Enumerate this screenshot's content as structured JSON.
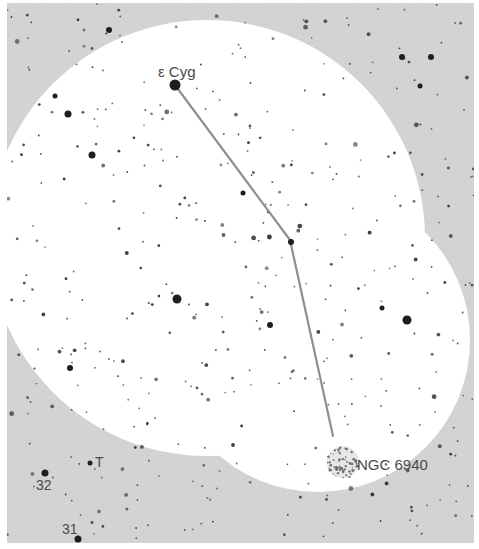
{
  "chart": {
    "frame": {
      "x": 7,
      "y": 3,
      "width": 467,
      "height": 540
    },
    "colors": {
      "background": "#ffffff",
      "field": "#cfcfcf",
      "field_of_view": "#ffffff",
      "star": "#2e2e2e",
      "path": "#8f8f8f",
      "label": "#4a4a4a"
    },
    "fields_of_view": [
      {
        "name": "finder-circle-1",
        "cx": 207,
        "cy": 238,
        "r": 218
      },
      {
        "name": "finder-circle-2",
        "cx": 318,
        "cy": 340,
        "r": 152
      }
    ],
    "star_hop_path": [
      [
        175,
        85
      ],
      [
        290,
        240
      ],
      [
        333,
        436
      ]
    ],
    "labels": {
      "epsilon_cyg": {
        "text": "ε Cyg",
        "x": 158,
        "y": 77,
        "size": 15
      },
      "ngc6940": {
        "text": "NGC 6940",
        "x": 357,
        "y": 470,
        "size": 15
      },
      "star_32": {
        "text": "32",
        "x": 36,
        "y": 490,
        "size": 14
      },
      "star_31": {
        "text": "31",
        "x": 62,
        "y": 534,
        "size": 14
      },
      "star_T": {
        "text": "T",
        "x": 95,
        "y": 467,
        "size": 14
      }
    },
    "bright_stars": [
      {
        "name": "epsilon-cyg",
        "x": 175,
        "y": 85,
        "r": 5.5
      },
      {
        "name": "star-32",
        "x": 45,
        "y": 473,
        "r": 3.5
      },
      {
        "name": "star-31",
        "x": 78,
        "y": 539,
        "r": 3.5
      },
      {
        "name": "star-T",
        "x": 90,
        "y": 463,
        "r": 2.5
      },
      {
        "name": "bright-mid",
        "x": 177,
        "y": 299,
        "r": 4.5
      },
      {
        "name": "bright-right",
        "x": 407,
        "y": 320,
        "r": 4.5
      },
      {
        "name": "bright-left",
        "x": 68,
        "y": 114,
        "r": 3.5
      },
      {
        "name": "bright-2",
        "x": 92,
        "y": 155,
        "r": 3.5
      },
      {
        "name": "bright-3",
        "x": 270,
        "y": 325,
        "r": 3
      },
      {
        "name": "bright-4",
        "x": 70,
        "y": 368,
        "r": 3
      },
      {
        "name": "bright-5",
        "x": 291,
        "y": 242,
        "r": 3
      },
      {
        "name": "bright-6",
        "x": 402,
        "y": 57,
        "r": 3
      },
      {
        "name": "bright-7",
        "x": 431,
        "y": 57,
        "r": 3
      },
      {
        "name": "bright-8",
        "x": 109,
        "y": 30,
        "r": 3
      },
      {
        "name": "bright-9",
        "x": 243,
        "y": 193,
        "r": 2.5
      },
      {
        "name": "bright-10",
        "x": 420,
        "y": 86,
        "r": 2.5
      },
      {
        "name": "bright-11",
        "x": 55,
        "y": 96,
        "r": 2.5
      },
      {
        "name": "bright-12",
        "x": 382,
        "y": 308,
        "r": 2.5
      }
    ],
    "cluster": {
      "name": "ngc-6940",
      "cx": 343,
      "cy": 462,
      "r": 16
    },
    "random_star_seed": 6940,
    "random_star_count": 430
  }
}
